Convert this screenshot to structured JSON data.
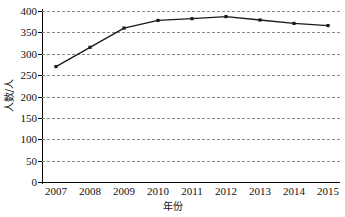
{
  "chart_data": {
    "type": "line",
    "title": "",
    "xlabel": "年份",
    "ylabel": "人数/人",
    "categories": [
      "2007",
      "2008",
      "2009",
      "2010",
      "2011",
      "2012",
      "2013",
      "2014",
      "2015"
    ],
    "values": [
      270,
      315,
      360,
      378,
      382,
      387,
      379,
      371,
      366
    ],
    "series": [
      {
        "name": "人数/人",
        "values": [
          270,
          315,
          360,
          378,
          382,
          387,
          379,
          371,
          366
        ]
      }
    ],
    "ylim": [
      0,
      400
    ],
    "yticks": [
      0,
      50,
      100,
      150,
      200,
      250,
      300,
      350,
      400
    ],
    "ytick_labels": [
      "0",
      "50",
      "100",
      "150",
      "200",
      "250",
      "300",
      "350",
      "400"
    ],
    "xtick_labels": [
      "2007",
      "2008",
      "2009",
      "2010",
      "2011",
      "2012",
      "2013",
      "2014",
      "2015"
    ],
    "grid": "horizontal-dashed",
    "legend": "none",
    "line_color": "#1a1a1a",
    "marker": "square",
    "marker_color": "#1a1a1a",
    "grid_color": "#8a8a8a",
    "axis_color": "#000000",
    "background": "#ffffff"
  }
}
